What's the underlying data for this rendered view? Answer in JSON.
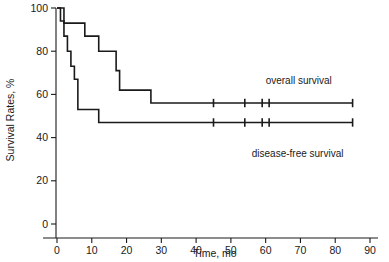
{
  "chart_data": {
    "type": "line",
    "title": "",
    "xlabel": "Time, mo",
    "ylabel": "Survival Rates, %",
    "xlim": [
      0,
      90
    ],
    "ylim": [
      0,
      100
    ],
    "xticks": [
      0,
      10,
      20,
      30,
      40,
      50,
      60,
      70,
      80,
      90
    ],
    "yticks": [
      0,
      20,
      40,
      60,
      80,
      100
    ],
    "xtick_labels": [
      "0",
      "10",
      "20",
      "30",
      "40",
      "50",
      "60",
      "70",
      "80",
      "90"
    ],
    "ytick_labels": [
      "0",
      "20",
      "40",
      "60",
      "80",
      "100"
    ],
    "grid": false,
    "legend_position": "inline-annotation",
    "series": [
      {
        "name": "overall survival",
        "label": "overall survival",
        "label_x": 60,
        "label_y": 65,
        "color": "#1a1a1a",
        "step_points": [
          [
            0,
            100
          ],
          [
            2,
            100
          ],
          [
            2,
            93
          ],
          [
            8,
            93
          ],
          [
            8,
            87
          ],
          [
            12,
            87
          ],
          [
            12,
            80
          ],
          [
            17,
            80
          ],
          [
            17,
            71
          ],
          [
            18,
            71
          ],
          [
            18,
            62
          ],
          [
            27,
            62
          ],
          [
            27,
            56
          ],
          [
            85,
            56
          ]
        ],
        "censor_times": [
          45,
          54,
          59,
          61,
          85
        ],
        "censor_value": 56
      },
      {
        "name": "disease-free survival",
        "label": "disease-free survival",
        "label_x": 56,
        "label_y": 31,
        "color": "#1a1a1a",
        "step_points": [
          [
            0,
            100
          ],
          [
            1,
            100
          ],
          [
            1,
            94
          ],
          [
            2,
            94
          ],
          [
            2,
            87
          ],
          [
            3,
            87
          ],
          [
            3,
            80
          ],
          [
            4,
            80
          ],
          [
            4,
            73
          ],
          [
            5,
            73
          ],
          [
            5,
            67
          ],
          [
            6,
            67
          ],
          [
            6,
            53
          ],
          [
            12,
            53
          ],
          [
            12,
            47
          ],
          [
            85,
            47
          ]
        ],
        "censor_times": [
          45,
          54,
          59,
          61,
          85
        ],
        "censor_value": 47
      }
    ]
  },
  "axes": {
    "x_title": "Time, mo",
    "y_title": "Survival Rates, %"
  }
}
